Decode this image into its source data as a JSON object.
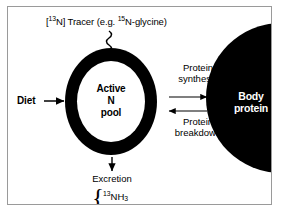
{
  "figure": {
    "background_color": "#ffffff",
    "ink_color": "#000000",
    "frame_color": "#9a9a9a"
  },
  "tracer": {
    "prefix": "[",
    "isotope_n13": "13",
    "element": "N",
    "label_mid": "] Tracer (e.g. ",
    "isotope_n15": "15",
    "label_end": "N-glycine)",
    "arrow_style": "squiggly-down"
  },
  "pool": {
    "line1": "Active",
    "line2": "N",
    "line3": "pool",
    "shape": "thick-black-ring",
    "fill": "#000000",
    "inner_fill": "#ffffff"
  },
  "diet": {
    "label": "Diet",
    "arrow_direction": "right"
  },
  "exchange": {
    "synthesis_line1": "Protein",
    "synthesis_line2": "synthesis",
    "synthesis_arrow_direction": "right",
    "breakdown_line1": "Protein",
    "breakdown_line2": "breakdown",
    "breakdown_arrow_direction": "left"
  },
  "body_protein": {
    "line1": "Body",
    "line2": "protein",
    "fill": "#000000",
    "text_color": "#ffffff"
  },
  "excretion": {
    "label": "Excretion",
    "arrow_direction": "down",
    "brace": "{",
    "product1_isotope": "13",
    "product1_formula": "NH",
    "product1_subscript": "3",
    "product2_prefix": "[",
    "product2_isotope": "13",
    "product2_element": "N",
    "product2_suffix": "] urea"
  }
}
